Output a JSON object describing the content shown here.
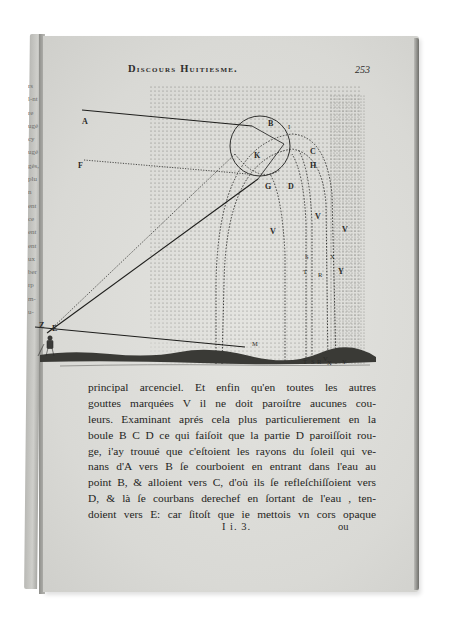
{
  "page": {
    "running_head": "Discours Huitiesme.",
    "page_number": "253",
    "signature": "I i. 3.",
    "catchword": "ou"
  },
  "left_page_margin_fragments": [
    "rs",
    "l-nt",
    "re",
    "ugé",
    "cy",
    "ugé",
    "gés,",
    "plu",
    "n",
    "ent",
    "ce",
    "ent",
    "ent",
    "ux",
    "ber",
    "rp",
    "m-",
    "u-"
  ],
  "figure": {
    "labels": {
      "A": "A",
      "B": "B",
      "I": "I",
      "C": "C",
      "K": "K",
      "H": "H",
      "F": "F",
      "G": "G",
      "D": "D",
      "V": "V",
      "S": "S",
      "X": "X",
      "T": "T",
      "R": "R",
      "Y": "Y",
      "Z": "Z",
      "E": "E",
      "M": "M"
    },
    "ground_labels": [
      "T",
      "S",
      "R",
      "V",
      "X",
      "Y"
    ]
  },
  "body_text": {
    "lines": [
      "principal arcenciel.   Et enfin qu'en toutes les autres",
      "gouttes marquées V il ne doit paroiſtre aucunes cou-",
      "leurs.   Examinant aprés cela plus particulierement en la",
      "boule  B C D ce qui faiſoit que la partie D paroiſſoit rou-",
      "ge, i'ay trouué que c'eſtoient les rayons du ſoleil  qui ve-",
      "nans d'A vers B ſe courboient en entrant dans l'eau au",
      "point B, & alloient vers C, d'où ils ſe refleſchiſſoient vers",
      "D, & là ſe courbans derechef en ſortant de l'eau , ten-",
      "doient vers E: car ſitoſt que ie mettois vn cors opaque"
    ]
  },
  "colors": {
    "paper": "#dededa",
    "ink": "#1f1f1d",
    "background": "#ffffff"
  }
}
